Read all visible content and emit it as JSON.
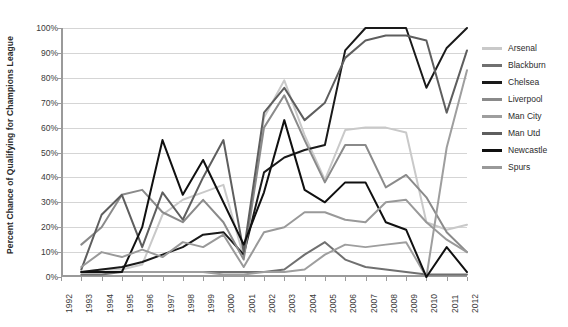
{
  "chart_data": {
    "type": "line",
    "title": "",
    "xlabel": "",
    "ylabel": "Percent Chance of Qualifying for Champions League",
    "ylim": [
      0,
      100
    ],
    "ytick_labels": [
      "0%",
      "10%",
      "20%",
      "30%",
      "40%",
      "50%",
      "60%",
      "70%",
      "80%",
      "90%",
      "100%"
    ],
    "ytick_values": [
      0,
      10,
      20,
      30,
      40,
      50,
      60,
      70,
      80,
      90,
      100
    ],
    "grid": true,
    "legend_position": "right",
    "x": [
      1992,
      1993,
      1994,
      1995,
      1996,
      1997,
      1998,
      1999,
      2000,
      2001,
      2002,
      2003,
      2004,
      2005,
      2006,
      2007,
      2008,
      2009,
      2010,
      2011,
      2012
    ],
    "categories": [
      "1992",
      "1993",
      "1994",
      "1995",
      "1996",
      "1997",
      "1998",
      "1999",
      "2000",
      "2001",
      "2002",
      "2003",
      "2004",
      "2005",
      "2006",
      "2007",
      "2008",
      "2009",
      "2010",
      "2011",
      "2012"
    ],
    "series": [
      {
        "name": "Arsenal",
        "color": "#c9c9c9",
        "values": [
          null,
          2,
          3,
          3,
          5,
          25,
          31,
          34,
          37,
          8,
          64,
          79,
          57,
          39,
          59,
          60,
          60,
          58,
          22,
          19,
          21
        ]
      },
      {
        "name": "Blackburn",
        "color": "#707070",
        "values": [
          null,
          1,
          1,
          2,
          2,
          2,
          2,
          2,
          2,
          2,
          2,
          3,
          9,
          14,
          7,
          4,
          3,
          2,
          1,
          1,
          1
        ]
      },
      {
        "name": "Chelsea",
        "color": "#1a1a1a",
        "values": [
          null,
          2,
          3,
          4,
          6,
          9,
          12,
          17,
          18,
          9,
          42,
          48,
          51,
          53,
          91,
          100,
          100,
          100,
          76,
          92,
          100
        ]
      },
      {
        "name": "Liverpool",
        "color": "#8a8a8a",
        "values": [
          null,
          13,
          20,
          33,
          35,
          26,
          22,
          31,
          22,
          7,
          60,
          73,
          55,
          38,
          53,
          53,
          36,
          41,
          32,
          18,
          10
        ]
      },
      {
        "name": "Man City",
        "color": "#9e9e9e",
        "values": [
          null,
          2,
          2,
          2,
          2,
          2,
          2,
          2,
          1,
          1,
          2,
          2,
          3,
          9,
          13,
          12,
          13,
          14,
          0,
          52,
          83
        ]
      },
      {
        "name": "Man Utd",
        "color": "#5e5e5e",
        "values": [
          null,
          3,
          25,
          33,
          12,
          34,
          23,
          40,
          55,
          10,
          66,
          76,
          63,
          70,
          88,
          95,
          97,
          97,
          95,
          66,
          91
        ]
      },
      {
        "name": "Newcastle",
        "color": "#101010",
        "values": [
          null,
          2,
          2,
          2,
          20,
          55,
          33,
          47,
          30,
          13,
          34,
          63,
          35,
          30,
          38,
          38,
          22,
          19,
          0,
          12,
          2
        ]
      },
      {
        "name": "Spurs",
        "color": "#999999",
        "values": [
          null,
          4,
          10,
          8,
          11,
          8,
          14,
          12,
          17,
          4,
          18,
          20,
          26,
          26,
          23,
          22,
          30,
          31,
          22,
          15,
          10
        ]
      }
    ]
  },
  "legend": {
    "items": [
      {
        "label": "Arsenal"
      },
      {
        "label": "Blackburn"
      },
      {
        "label": "Chelsea"
      },
      {
        "label": "Liverpool"
      },
      {
        "label": "Man City"
      },
      {
        "label": "Man Utd"
      },
      {
        "label": "Newcastle"
      },
      {
        "label": "Spurs"
      }
    ]
  }
}
